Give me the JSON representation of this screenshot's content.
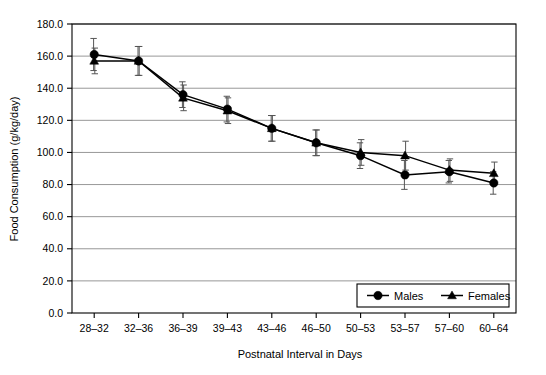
{
  "chart_data": {
    "type": "line",
    "title": "",
    "xlabel": "Postnatal Interval in Days",
    "ylabel": "Food Consumption (g/kg/day)",
    "categories": [
      "28–32",
      "32–36",
      "36–39",
      "39–43",
      "43–46",
      "46–50",
      "50–53",
      "53–57",
      "57–60",
      "60–64"
    ],
    "ylim": [
      0,
      180
    ],
    "yticks": [
      "0.0",
      "20.0",
      "40.0",
      "60.0",
      "80.0",
      "100.0",
      "120.0",
      "140.0",
      "160.0",
      "180.0"
    ],
    "ytick_values": [
      0,
      20,
      40,
      60,
      80,
      100,
      120,
      140,
      160,
      180
    ],
    "grid": "horizontal",
    "legend_position": "bottom-right",
    "errorbars": true,
    "series": [
      {
        "name": "Males",
        "marker": "circle",
        "values": [
          161.0,
          157.0,
          136.0,
          127.0,
          115.0,
          106.0,
          98.0,
          86.0,
          88.0,
          81.0
        ],
        "err_up": [
          10.0,
          9.0,
          8.0,
          8.0,
          8.0,
          8.0,
          8.0,
          9.0,
          7.0,
          7.0
        ],
        "err_dn": [
          10.0,
          9.0,
          8.0,
          8.0,
          8.0,
          8.0,
          8.0,
          9.0,
          7.0,
          7.0
        ]
      },
      {
        "name": "Females",
        "marker": "triangle",
        "values": [
          157.0,
          157.0,
          134.0,
          126.0,
          115.0,
          106.0,
          100.0,
          98.0,
          89.0,
          87.0
        ],
        "err_up": [
          8.0,
          9.0,
          8.0,
          8.0,
          8.0,
          8.0,
          8.0,
          9.0,
          7.0,
          7.0
        ],
        "err_dn": [
          8.0,
          9.0,
          8.0,
          8.0,
          8.0,
          8.0,
          8.0,
          9.0,
          7.0,
          7.0
        ]
      }
    ]
  },
  "legend": {
    "items": [
      {
        "label": "Males"
      },
      {
        "label": "Females"
      }
    ]
  },
  "colors": {
    "series": "#000000",
    "grid": "#8c8c8c",
    "axis": "#000000",
    "background": "#ffffff"
  }
}
